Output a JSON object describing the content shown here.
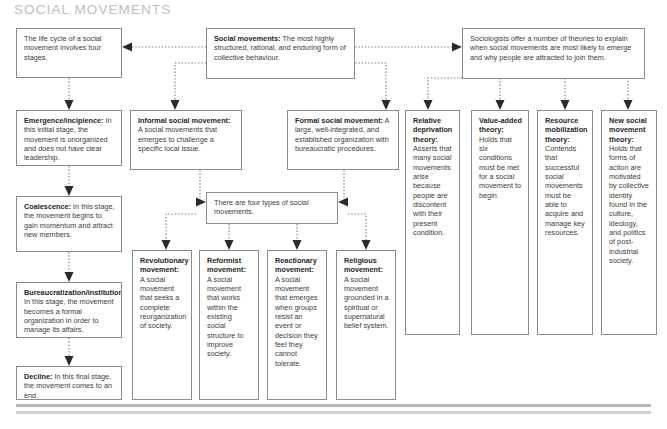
{
  "page": {
    "title": "SOCIAL MOVEMENTS",
    "title_color": "#c0c0c0",
    "box_border_color": "#8c8c8c",
    "connector_color": "#7a7a7a",
    "arrowhead_color": "#2b2b2b",
    "background": "#ffffff"
  },
  "diagram": {
    "type": "flowchart",
    "life_cycle_intro": {
      "label": "",
      "text": "The life cycle of a social movement involves four stages."
    },
    "definition": {
      "label": "Social movements:",
      "text": " The most highly structured, rational, and enduring form of collective behaviour."
    },
    "theories_intro": {
      "label": "",
      "text": "Sociologists offer a number of theories to explain when social movements are most likely to emerge and why people are attracted to join them."
    },
    "four_types_intro": {
      "label": "",
      "text": "There are four types of social movements."
    },
    "stages": [
      {
        "label": "Emergence/incipience:",
        "text": " In this initial stage, the movement is unorganized and does not have clear leadership."
      },
      {
        "label": "Coalescence:",
        "text": " In this stage, the movement begins to gain momentum and attract new members."
      },
      {
        "label": "Bureaucratization/institutionalization:",
        "text": " In this stage, the movement becomes a formal organization in order to manage its affairs."
      },
      {
        "label": "Decline:",
        "text": " In this final stage, the movement comes to an end."
      }
    ],
    "forms": [
      {
        "label": "Informal social movement:",
        "text": " A social movements that emerges to challenge a specific local issue."
      },
      {
        "label": "Formal social movement:",
        "text": " A large, well-integrated, and established organization with bureaucratic procedures."
      }
    ],
    "types": [
      {
        "label": "Revolutionary movement:",
        "text": " A social movement that seeks a complete reorganization of society."
      },
      {
        "label": "Reformist movement:",
        "text": " A social movement that works within the existing social structure to improve society."
      },
      {
        "label": "Reactionary movement:",
        "text": " A social movement that emerges when groups resist an event or decision they feel they cannot tolerate."
      },
      {
        "label": "Religious movement:",
        "text": " A social movement grounded in a spiritual or supernatural belief system."
      }
    ],
    "theories": [
      {
        "label": "Relative deprivation theory:",
        "text": " Asserts that many social movements arise because people are discontent with their present condition."
      },
      {
        "label": "Value-added theory:",
        "text": " Holds that six conditions must be met for a social movement to begin."
      },
      {
        "label": "Resource mobilization theory:",
        "text": " Contends that successful social movements must be able to acquire and manage key resources."
      },
      {
        "label": "New social movement theory:",
        "text": " Holds that forms of action are motivated by collective identity found in the culture, ideology, and politics of post-industrial society."
      }
    ]
  }
}
